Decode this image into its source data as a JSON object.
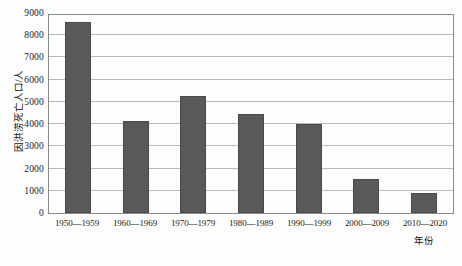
{
  "chart_data": {
    "type": "bar",
    "title": "",
    "xlabel": "年份",
    "ylabel": "因洪涝死亡人口/人",
    "categories": [
      "1950—1959",
      "1960—1969",
      "1970—1979",
      "1980—1989",
      "1990—1999",
      "2000—2009",
      "2010—2020"
    ],
    "values": [
      8600,
      4150,
      5250,
      4450,
      4000,
      1550,
      880
    ],
    "ylim": [
      0,
      9000
    ],
    "ytick_labels": [
      "0",
      "1000",
      "2000",
      "3000",
      "4000",
      "5000",
      "6000",
      "7000",
      "8000",
      "9000"
    ],
    "ytick_values": [
      0,
      1000,
      2000,
      3000,
      4000,
      5000,
      6000,
      7000,
      8000,
      9000
    ],
    "grid": true,
    "legend": "none",
    "bar_color": "#595959",
    "grid_color": "#b9b9b9",
    "axis_color": "#8a8a8a"
  }
}
